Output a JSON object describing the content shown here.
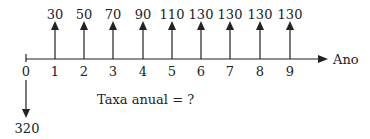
{
  "diagram": {
    "type": "cash-flow",
    "axis_label": "Ano",
    "periods": [
      "0",
      "1",
      "2",
      "3",
      "4",
      "5",
      "6",
      "7",
      "8",
      "9"
    ],
    "inflows": [
      {
        "period": "1",
        "value": "30"
      },
      {
        "period": "2",
        "value": "50"
      },
      {
        "period": "3",
        "value": "70"
      },
      {
        "period": "4",
        "value": "90"
      },
      {
        "period": "5",
        "value": "110"
      },
      {
        "period": "6",
        "value": "130"
      },
      {
        "period": "7",
        "value": "130"
      },
      {
        "period": "8",
        "value": "130"
      },
      {
        "period": "9",
        "value": "130"
      }
    ],
    "outflow": {
      "period": "0",
      "value": "320"
    },
    "note": "Taxa anual = ?"
  }
}
